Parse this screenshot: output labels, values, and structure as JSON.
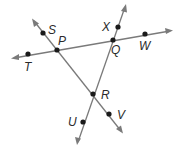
{
  "diagram": {
    "type": "geometry-lines",
    "colors": {
      "line": "#7a7a7a",
      "point": "#1a1a1a",
      "label": "#2a2a2a",
      "background": "#ffffff"
    },
    "lines": [
      {
        "name": "line-TW",
        "through": [
          "T",
          "P",
          "Q",
          "W"
        ]
      },
      {
        "name": "line-SV",
        "through": [
          "S",
          "P",
          "R",
          "V"
        ]
      },
      {
        "name": "line-XU",
        "through": [
          "X",
          "Q",
          "R",
          "U"
        ]
      }
    ],
    "points": {
      "S": {
        "label": "S"
      },
      "P": {
        "label": "P"
      },
      "T": {
        "label": "T"
      },
      "X": {
        "label": "X"
      },
      "Q": {
        "label": "Q"
      },
      "W": {
        "label": "W"
      },
      "R": {
        "label": "R"
      },
      "U": {
        "label": "U"
      },
      "V": {
        "label": "V"
      }
    }
  }
}
